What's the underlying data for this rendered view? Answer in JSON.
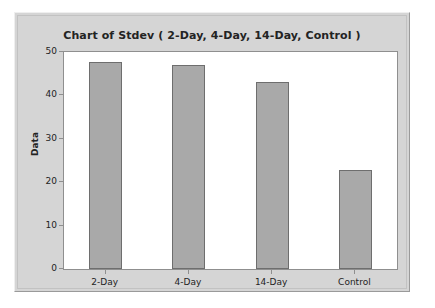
{
  "chart_data": {
    "type": "bar",
    "title": "Chart of Stdev ( 2-Day, 4-Day, 14-Day, Control )",
    "xlabel": "",
    "ylabel": "Data",
    "categories": [
      "2-Day",
      "4-Day",
      "14-Day",
      "Control"
    ],
    "values": [
      47.6,
      47.0,
      43.2,
      22.7
    ],
    "ylim": [
      0,
      50
    ],
    "yticks": [
      0,
      10,
      20,
      30,
      40,
      50
    ],
    "ytick_labels": [
      "0",
      "10",
      "20",
      "30",
      "40",
      "50"
    ],
    "grid": false,
    "legend": null,
    "bar_color": "#a9a9a9",
    "bar_edge_color": "#6e6e6e",
    "panel_color": "#d5d5d5",
    "plot_background": "#ffffff",
    "text_color": "#232323"
  }
}
